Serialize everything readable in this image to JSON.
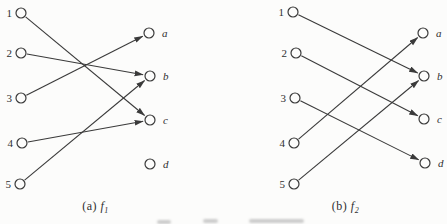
{
  "colors": {
    "ink": "#3a3a3a",
    "paper": "#fcfcfb",
    "node_fill": "#fcfcfb"
  },
  "diagrams": [
    {
      "name": "f1",
      "caption_prefix": "(a)",
      "caption_fn": "f",
      "caption_sub": "1",
      "left_nodes": [
        {
          "label": "1",
          "x": 21,
          "y": 13
        },
        {
          "label": "2",
          "x": 21,
          "y": 53
        },
        {
          "label": "3",
          "x": 21,
          "y": 98
        },
        {
          "label": "4",
          "x": 22,
          "y": 143
        },
        {
          "label": "5",
          "x": 20,
          "y": 184
        }
      ],
      "right_nodes": [
        {
          "label": "a",
          "x": 149,
          "y": 33
        },
        {
          "label": "b",
          "x": 150,
          "y": 76
        },
        {
          "label": "c",
          "x": 150,
          "y": 120
        },
        {
          "label": "d",
          "x": 150,
          "y": 164
        }
      ],
      "edges": [
        {
          "from": "1",
          "to": "c"
        },
        {
          "from": "2",
          "to": "b"
        },
        {
          "from": "3",
          "to": "a"
        },
        {
          "from": "4",
          "to": "c"
        },
        {
          "from": "5",
          "to": "b"
        }
      ]
    },
    {
      "name": "f2",
      "caption_prefix": "(b)",
      "caption_fn": "f",
      "caption_sub": "2",
      "left_nodes": [
        {
          "label": "1",
          "x": 293,
          "y": 12
        },
        {
          "label": "2",
          "x": 296,
          "y": 53
        },
        {
          "label": "3",
          "x": 295,
          "y": 98
        },
        {
          "label": "4",
          "x": 294,
          "y": 143
        },
        {
          "label": "5",
          "x": 294,
          "y": 184
        }
      ],
      "right_nodes": [
        {
          "label": "a",
          "x": 423,
          "y": 33
        },
        {
          "label": "b",
          "x": 424,
          "y": 76
        },
        {
          "label": "c",
          "x": 424,
          "y": 119
        },
        {
          "label": "d",
          "x": 425,
          "y": 163
        }
      ],
      "edges": [
        {
          "from": "1",
          "to": "b"
        },
        {
          "from": "2",
          "to": "c"
        },
        {
          "from": "3",
          "to": "d"
        },
        {
          "from": "4",
          "to": "a"
        },
        {
          "from": "5",
          "to": "b"
        }
      ]
    }
  ]
}
